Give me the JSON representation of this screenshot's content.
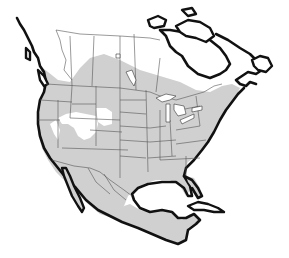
{
  "map": {
    "type": "species-range-map",
    "region": "North America",
    "legend": [],
    "colors": {
      "background": "#ffffff",
      "land_outside_range": "#ffffff",
      "range_fill": "#d0d0d0",
      "coastline": "#111111",
      "political_borders": "#555555"
    },
    "features": [
      {
        "name": "range-shading",
        "description": "Gray shaded distribution covering most of contiguous US, Mexico, and southern Canada"
      },
      {
        "name": "unshaded-great-basin",
        "description": "White gaps in Nevada/Utah/Wyoming interior"
      },
      {
        "name": "unshaded-northern-canada",
        "description": "Northern Canada and Arctic islands unshaded"
      },
      {
        "name": "greenland",
        "description": "Partial outline top-right"
      },
      {
        "name": "cuba",
        "description": "Island in Caribbean"
      }
    ]
  }
}
